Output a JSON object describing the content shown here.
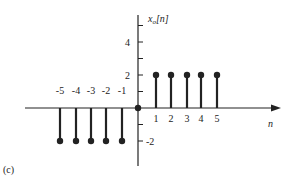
{
  "figure": {
    "panel_label": "(c)"
  },
  "chart_data": {
    "type": "stem",
    "title": "",
    "xlabel": "n",
    "ylabel": "x_o[n]",
    "x": [
      -5,
      -4,
      -3,
      -2,
      -1,
      0,
      1,
      2,
      3,
      4,
      5
    ],
    "values": [
      -2,
      -2,
      -2,
      -2,
      -2,
      0,
      2,
      2,
      2,
      2,
      2
    ],
    "x_tick_labels": [
      "-5",
      "-4",
      "-3",
      "-2",
      "-1",
      "1",
      "2",
      "3",
      "4",
      "5"
    ],
    "y_tick_labels": [
      "4",
      "2",
      "-2"
    ],
    "y_ticks_minor": [
      5,
      4,
      3,
      2,
      1,
      -1,
      -2
    ],
    "ylim": [
      -3,
      5.5
    ],
    "xlim": [
      -7,
      9
    ],
    "grid": false,
    "legend": null,
    "color": "#222222"
  }
}
